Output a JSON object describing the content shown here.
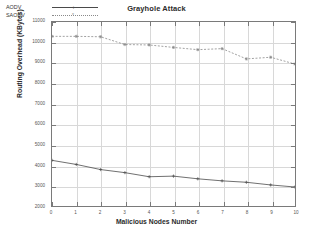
{
  "chart_data": {
    "type": "line",
    "title": "Grayhole Attack",
    "xlabel": "Malicious Nodes Number",
    "ylabel": "Routing Overhead (KBytes)",
    "x": [
      0,
      1,
      2,
      3,
      4,
      5,
      6,
      7,
      8,
      9,
      10
    ],
    "xlim": [
      0,
      10
    ],
    "ylim": [
      2000,
      11000
    ],
    "xticks": [
      "0",
      "1",
      "2",
      "3",
      "4",
      "5",
      "6",
      "7",
      "8",
      "9",
      "10"
    ],
    "yticks": [
      "2000",
      "3000",
      "4000",
      "5000",
      "6000",
      "7000",
      "8000",
      "9000",
      "10000",
      "11000"
    ],
    "grid": true,
    "legend_position": "top-left",
    "series": [
      {
        "name": "AODV",
        "style": "solid",
        "marker": "plus",
        "color": "#4a4a4a",
        "values": [
          4250,
          4050,
          3800,
          3650,
          3450,
          3480,
          3350,
          3250,
          3180,
          3050,
          2950
        ]
      },
      {
        "name": "SAODV",
        "style": "dashed",
        "marker": "star",
        "color": "#8a8a8a",
        "values": [
          10300,
          10300,
          10280,
          9900,
          9880,
          9760,
          9650,
          9700,
          9200,
          9280,
          8950
        ]
      }
    ]
  }
}
